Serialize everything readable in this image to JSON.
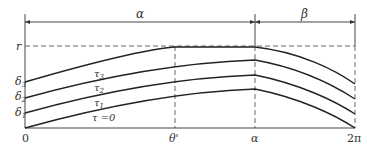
{
  "diagram": {
    "top_segments": [
      {
        "label": "α"
      },
      {
        "label": "β"
      }
    ],
    "y_labels": {
      "r": "r",
      "delta3": "δ",
      "delta3_sub": "3",
      "delta2": "δ",
      "delta2_sub": "2",
      "delta1": "δ",
      "delta1_sub": "1"
    },
    "x_labels": {
      "origin": "0",
      "theta_prime": "θ'",
      "alpha": "α",
      "two_pi": "2π"
    },
    "curves": [
      {
        "name": "τ3",
        "label": "τ",
        "sub": "3"
      },
      {
        "name": "τ2",
        "label": "τ",
        "sub": "2"
      },
      {
        "name": "τ1",
        "label": "τ",
        "sub": "1"
      },
      {
        "name": "τ=0",
        "label": "τ =0",
        "sub": ""
      }
    ]
  }
}
